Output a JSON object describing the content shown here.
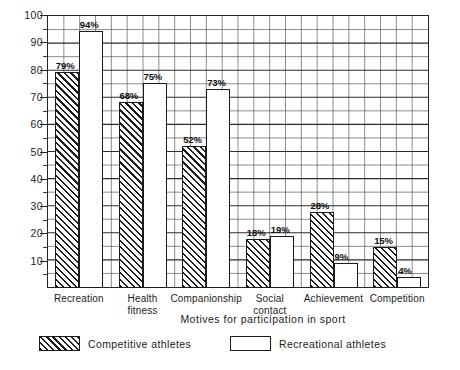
{
  "chart_data": {
    "type": "bar",
    "title": "",
    "xlabel": "Motives for participation in sport",
    "ylabel": "",
    "ylim": [
      0,
      100
    ],
    "ytick_values": [
      10,
      20,
      30,
      40,
      50,
      60,
      70,
      80,
      90,
      100
    ],
    "ytick_labels": [
      "10",
      "20",
      "30",
      "40",
      "50",
      "60",
      "70",
      "80",
      "90",
      "100"
    ],
    "minor_tick_step": 5,
    "grid": true,
    "grid_note": "rectangular grid, vertical lines every 5 percent-units of width",
    "legend_position": "below-axis-left",
    "categories": [
      "Recreation",
      "Health\nfitness",
      "Companionship",
      "Social\ncontact",
      "Achievement",
      "Competition"
    ],
    "series": [
      {
        "name": "Competitive athletes",
        "pattern": "diagonal-hatch",
        "values": [
          79,
          68,
          52,
          18,
          28,
          15
        ],
        "value_labels": [
          "79%",
          "68%",
          "52%",
          "18%",
          "28%",
          "15%"
        ]
      },
      {
        "name": "Recreational athletes",
        "pattern": "open-white",
        "values": [
          94,
          75,
          73,
          19,
          9,
          4
        ],
        "value_labels": [
          "94%",
          "75%",
          "73%",
          "19%",
          "9%",
          "4%"
        ]
      }
    ]
  },
  "legend": {
    "items": [
      {
        "label": "Competitive athletes",
        "swatch": "hatched-swatch"
      },
      {
        "label": "Recreational athletes",
        "swatch": "open-swatch"
      }
    ]
  }
}
